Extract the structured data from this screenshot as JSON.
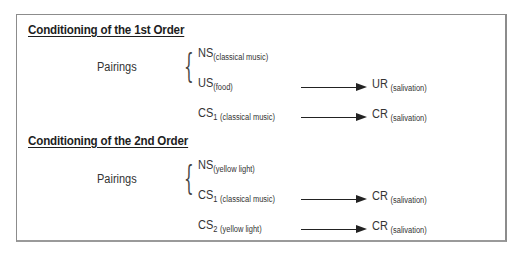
{
  "sections": [
    {
      "heading": "Conditioning of the 1st Order",
      "pairings_label": "Pairings",
      "pair_items": [
        {
          "symbol": "NS",
          "sub": "",
          "note": "(classical music)"
        },
        {
          "symbol": "US",
          "sub": "",
          "note": "(food)"
        }
      ],
      "relations": [
        {
          "stimulus": {
            "symbol": "US",
            "sub": "",
            "note": "(food)"
          },
          "response": {
            "symbol": "UR",
            "note": "(salivation)"
          }
        },
        {
          "stimulus": {
            "symbol": "CS",
            "sub": "1",
            "note": "(classical music)"
          },
          "response": {
            "symbol": "CR",
            "note": "(salivation)"
          }
        }
      ]
    },
    {
      "heading": "Conditioning of the 2nd Order",
      "pairings_label": "Pairings",
      "pair_items": [
        {
          "symbol": "NS",
          "sub": "",
          "note": "(yellow light)"
        },
        {
          "symbol": "CS",
          "sub": "1",
          "note": "(classical music)"
        }
      ],
      "relations": [
        {
          "stimulus": {
            "symbol": "CS",
            "sub": "1",
            "note": "(classical music)"
          },
          "response": {
            "symbol": "CR",
            "note": "(salivation)"
          }
        },
        {
          "stimulus": {
            "symbol": "CS",
            "sub": "2",
            "note": "(yellow light)"
          },
          "response": {
            "symbol": "CR",
            "note": "(salivation)"
          }
        }
      ]
    }
  ],
  "brace_glyph": "{"
}
